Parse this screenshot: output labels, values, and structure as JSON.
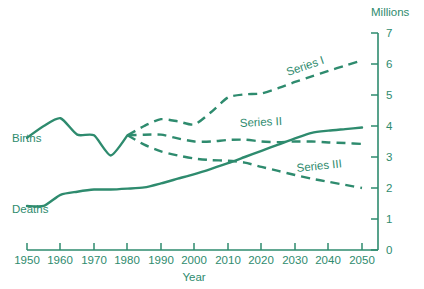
{
  "chart_data": {
    "type": "line",
    "title": "",
    "xlabel": "Year",
    "ylabel": "Millions",
    "ylim": [
      0,
      7
    ],
    "xlim": [
      1950,
      2050
    ],
    "grid": false,
    "legend_position": "inline-labels",
    "y_ticks": [
      "0",
      "1",
      "2",
      "3",
      "4",
      "5",
      "6",
      "7"
    ],
    "x_ticks": [
      "1950",
      "1960",
      "1970",
      "1980",
      "1990",
      "2000",
      "2010",
      "2020",
      "2030",
      "2040",
      "2050"
    ],
    "y_axis_side": "right",
    "annotations": [
      "Births",
      "Deaths",
      "Series I",
      "Series II",
      "Series III"
    ],
    "series": [
      {
        "name": "Births",
        "style": "solid",
        "label": "Births",
        "x": [
          1950,
          1955,
          1960,
          1965,
          1970,
          1975,
          1980
        ],
        "values": [
          3.62,
          4.0,
          4.25,
          3.72,
          3.7,
          3.05,
          3.7
        ]
      },
      {
        "name": "Deaths",
        "style": "solid",
        "label": "Deaths",
        "x": [
          1950,
          1955,
          1960,
          1965,
          1970,
          1975,
          1980,
          1985,
          1990,
          1995,
          2000,
          2005,
          2010,
          2015,
          2020,
          2025,
          2030,
          2035,
          2040,
          2045,
          2050
        ],
        "values": [
          1.42,
          1.42,
          1.78,
          1.88,
          1.95,
          1.95,
          1.98,
          2.02,
          2.15,
          2.3,
          2.45,
          2.62,
          2.8,
          3.0,
          3.2,
          3.4,
          3.6,
          3.78,
          3.85,
          3.9,
          3.95
        ]
      },
      {
        "name": "Series I",
        "style": "dashed",
        "label": "Series I",
        "x": [
          1980,
          1985,
          1990,
          1995,
          2000,
          2005,
          2010,
          2015,
          2020,
          2025,
          2030,
          2035,
          2040,
          2045,
          2050
        ],
        "values": [
          3.7,
          4.0,
          4.22,
          4.15,
          4.05,
          4.45,
          4.92,
          5.02,
          5.05,
          5.22,
          5.42,
          5.6,
          5.78,
          5.95,
          6.12
        ]
      },
      {
        "name": "Series II",
        "style": "dashed",
        "label": "Series II",
        "x": [
          1980,
          1985,
          1990,
          1995,
          2000,
          2005,
          2010,
          2015,
          2020,
          2025,
          2030,
          2035,
          2040,
          2045,
          2050
        ],
        "values": [
          3.7,
          3.72,
          3.72,
          3.6,
          3.5,
          3.5,
          3.55,
          3.56,
          3.5,
          3.48,
          3.5,
          3.5,
          3.47,
          3.45,
          3.42
        ]
      },
      {
        "name": "Series III",
        "style": "dashed",
        "label": "Series III",
        "x": [
          1980,
          1985,
          1990,
          1995,
          2000,
          2005,
          2010,
          2015,
          2020,
          2025,
          2030,
          2035,
          2040,
          2045,
          2050
        ],
        "values": [
          3.7,
          3.4,
          3.18,
          3.05,
          2.95,
          2.9,
          2.88,
          2.82,
          2.68,
          2.55,
          2.42,
          2.3,
          2.2,
          2.1,
          2.0
        ]
      }
    ]
  },
  "labels": {
    "unit": "Millions",
    "x_axis_title": "Year",
    "births": "Births",
    "deaths": "Deaths",
    "series_1": "Series I",
    "series_2": "Series II",
    "series_3": "Series III"
  },
  "colors": {
    "line": "#2e8b6e",
    "text": "#2e8b6e",
    "background": "#ffffff"
  },
  "caption_sliver": ""
}
